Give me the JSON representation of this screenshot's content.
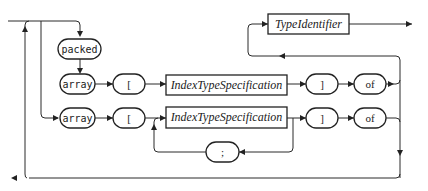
{
  "diagram": {
    "type": "syntax-diagram",
    "terminals": {
      "packed": "packed",
      "array_top": "array",
      "lbracket_top": "[",
      "rbracket_top": "]",
      "of_top": "of",
      "array_bottom": "array",
      "lbracket_bottom": "[",
      "rbracket_bottom": "]",
      "of_bottom": "of",
      "separator": ";"
    },
    "nonterminals": {
      "type_identifier": "TypeIdentifier",
      "index_top": "IndexTypeSpecification",
      "index_bottom": "IndexTypeSpecification"
    }
  }
}
